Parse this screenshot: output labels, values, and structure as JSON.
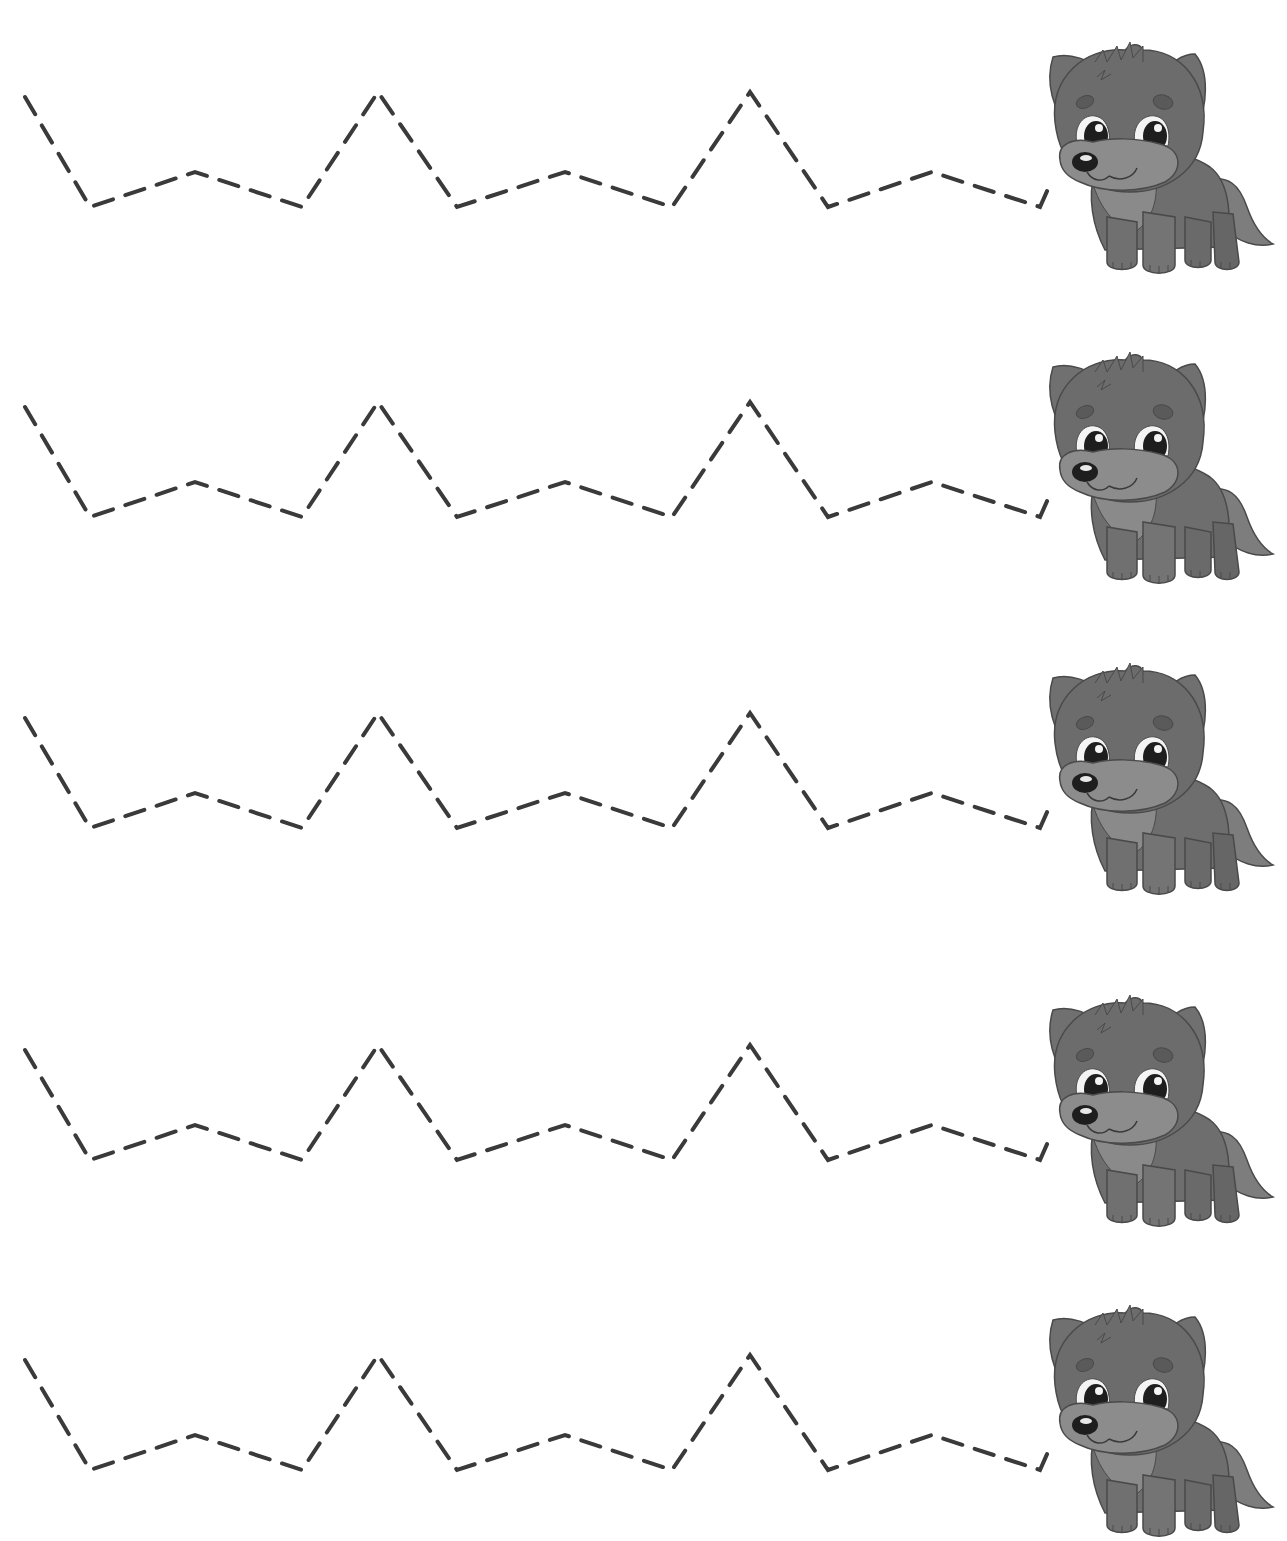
{
  "worksheet": {
    "type": "line-tracing-worksheet",
    "row_count": 5,
    "colors": {
      "background": "#ffffff",
      "dash": "#3a3a3a",
      "wolf_fur": "#7a7a7a",
      "wolf_fur_dark": "#5e5e5e",
      "wolf_muzzle": "#8c8c8c",
      "wolf_outline": "#4a4a4a",
      "eye": "#1e1e1e",
      "eye_highlight": "#f4f4f4"
    },
    "path_template": [
      [
        25,
        5
      ],
      [
        90,
        115
      ],
      [
        195,
        80
      ],
      [
        302,
        115
      ],
      [
        378,
        0
      ],
      [
        457,
        115
      ],
      [
        565,
        80
      ],
      [
        672,
        115
      ],
      [
        750,
        0
      ],
      [
        828,
        115
      ],
      [
        932,
        80
      ],
      [
        1040,
        115
      ],
      [
        1052,
        88
      ]
    ],
    "rows": [
      {
        "index": 1,
        "offset_y": 92,
        "wolf_icon": "wolf-cub-icon"
      },
      {
        "index": 2,
        "offset_y": 402,
        "wolf_icon": "wolf-cub-icon"
      },
      {
        "index": 3,
        "offset_y": 713,
        "wolf_icon": "wolf-cub-icon"
      },
      {
        "index": 4,
        "offset_y": 1045,
        "wolf_icon": "wolf-cub-icon"
      },
      {
        "index": 5,
        "offset_y": 1355,
        "wolf_icon": "wolf-cub-icon"
      }
    ]
  }
}
